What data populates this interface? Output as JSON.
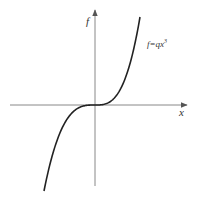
{
  "chart_data": {
    "type": "line",
    "title": "",
    "xlabel": "x",
    "ylabel": "f",
    "curve_label": "f=qx",
    "curve_label_exponent": "3",
    "function": "f = q x^3",
    "q": 1,
    "x_range": [
      -1.3,
      1.2
    ],
    "y_range": [
      -2.2,
      2.2
    ],
    "grid": false,
    "colors": {
      "axis": "#888888",
      "curve": "#222222",
      "text": "#333333"
    }
  }
}
